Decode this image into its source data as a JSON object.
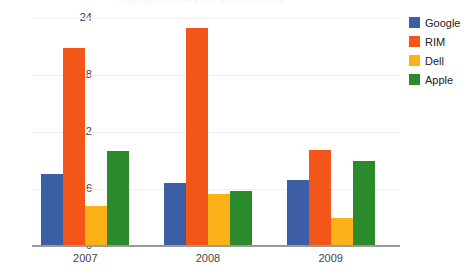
{
  "chart_data": {
    "type": "bar",
    "title": "Smartphone Market Share by Year",
    "xlabel": "",
    "ylabel": "",
    "categories": [
      "2007",
      "2008",
      "2009"
    ],
    "series": [
      {
        "name": "Google",
        "color": "#3b5ea5",
        "values": [
          7.6,
          6.6,
          6.9
        ]
      },
      {
        "name": "RIM",
        "color": "#f4561a",
        "values": [
          20.8,
          23.0,
          10.1
        ]
      },
      {
        "name": "Dell",
        "color": "#fbb117",
        "values": [
          4.2,
          5.5,
          3.0
        ]
      },
      {
        "name": "Apple",
        "color": "#2b8a2b",
        "values": [
          10.0,
          5.8,
          8.9
        ]
      }
    ],
    "ylim": [
      0,
      24
    ],
    "yticks": [
      0,
      6,
      12,
      18,
      24
    ],
    "ytick_labels": [
      "0",
      "6",
      "12",
      "18",
      "24"
    ],
    "grid": true,
    "legend_position": "right"
  },
  "colors": {
    "gridline": "#eeeeee",
    "axis": "#9a9a9a",
    "tick_text": "#444444",
    "background": "#ffffff"
  }
}
